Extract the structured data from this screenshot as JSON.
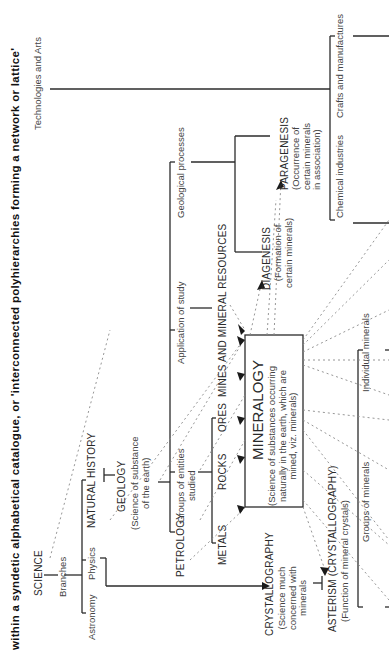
{
  "caption": "within a syndetic alphabetical catalogue, or 'interconnected polyhierarchies forming a network or lattice'",
  "nodes": {
    "science": "SCIENCE",
    "branches": "Branches",
    "astronomy": "Astronomy",
    "physics": "Physics",
    "natural_history": "NATURAL HISTORY",
    "geology": "GEOLOGY",
    "geology_desc": "(Science of substance\nof the earth)",
    "petrology": "PETROLOGY",
    "groups_entities": "Groups of entities\nstudied",
    "metals": "METALS",
    "rocks": "ROCKS",
    "ores": "ORES",
    "mines": "MINES AND MINERAL RESOURCES",
    "application": "Application of study",
    "geological_processes": "Geological processes",
    "diagenesis": "DIAGENESIS",
    "diagenesis_desc": "(Formation of\ncertain minerals)",
    "paragenesis": "PARAGENESIS",
    "paragenesis_desc": "(Occurrence of\ncertain minerals\nin association)",
    "mineralogy": "MINERALOGY",
    "mineralogy_desc": "(Science of substances occurring\nnaturally in the earth, which are\nmined, viz. minerals)",
    "crystallography": "CRYSTALLOGRAPHY",
    "crystallography_desc": "(Science much\nconcerned with\nminerals",
    "asterism": "ASTERISM (CRYSTALLOGRAPHY)",
    "asterism_desc": "(Function of mineral crystals)",
    "groups_minerals": "Groups of minerals",
    "individual_minerals": "Individual minerals",
    "technologies": "Technologies and Arts",
    "chemical": "Chemical industries",
    "crafts": "Crafts and manufactures"
  },
  "colors": {
    "line": "#2b2b2b",
    "dotted": "#8a8a8a",
    "text": "#2a2a2a"
  }
}
